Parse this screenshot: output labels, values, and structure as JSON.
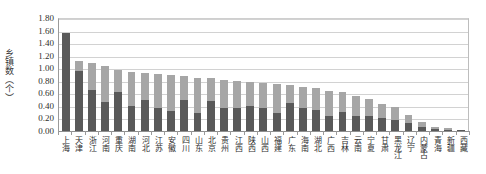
{
  "chart": {
    "type": "bar",
    "y_axis_title": "乡镇数（个）",
    "x_axis_title": "",
    "title": "",
    "colors": {
      "series_bottom": "#595959",
      "series_top": "#a6a6a6",
      "gridline": "#d2d2d2",
      "axis": "#8f8f8f",
      "text": "#2f2f2f"
    }
  },
  "y_ticks": [
    "0.00",
    "0.20",
    "0.40",
    "0.60",
    "0.80",
    "1.00",
    "1.20",
    "1.40",
    "1.60",
    "1.80"
  ],
  "chart_data": {
    "type": "bar",
    "stacked": true,
    "title": "",
    "xlabel": "",
    "ylabel": "乡镇数（个）",
    "ylim": [
      0.0,
      1.8
    ],
    "ytick_step": 0.2,
    "grid": true,
    "legend": null,
    "categories": [
      "上海",
      "天津",
      "浙江",
      "河南",
      "重庆",
      "湖南",
      "河北",
      "江苏",
      "安徽",
      "四川",
      "山东",
      "北京",
      "贵州",
      "江西",
      "陕西",
      "山西",
      "福建",
      "广东",
      "海南",
      "湖北",
      "广西",
      "吉林",
      "云南",
      "宁夏",
      "甘肃",
      "黑龙江",
      "辽宁",
      "内蒙古",
      "青海",
      "新疆",
      "西藏"
    ],
    "series": [
      {
        "name": "系列1",
        "values": [
          1.56,
          0.95,
          0.66,
          0.46,
          0.62,
          0.4,
          0.49,
          0.36,
          0.32,
          0.49,
          0.29,
          0.48,
          0.36,
          0.37,
          0.4,
          0.37,
          0.28,
          0.45,
          0.36,
          0.33,
          0.24,
          0.3,
          0.24,
          0.24,
          0.2,
          0.17,
          0.13,
          0.07,
          0.03,
          0.02,
          0.01
        ]
      },
      {
        "name": "系列2",
        "values": [
          0.0,
          0.16,
          0.42,
          0.57,
          0.35,
          0.54,
          0.43,
          0.55,
          0.57,
          0.38,
          0.56,
          0.36,
          0.46,
          0.43,
          0.38,
          0.39,
          0.47,
          0.28,
          0.34,
          0.35,
          0.4,
          0.32,
          0.32,
          0.27,
          0.23,
          0.22,
          0.13,
          0.08,
          0.03,
          0.03,
          0.01
        ]
      }
    ],
    "totals": [
      1.56,
      1.11,
      1.08,
      1.03,
      0.97,
      0.94,
      0.92,
      0.91,
      0.89,
      0.87,
      0.85,
      0.84,
      0.82,
      0.8,
      0.78,
      0.76,
      0.75,
      0.73,
      0.7,
      0.68,
      0.64,
      0.62,
      0.56,
      0.51,
      0.43,
      0.39,
      0.26,
      0.15,
      0.06,
      0.05,
      0.02
    ]
  }
}
